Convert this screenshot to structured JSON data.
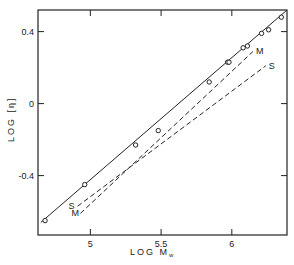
{
  "chart_data": {
    "type": "scatter",
    "title": "",
    "xlabel": "LOG M",
    "xlabel_subscript": "w",
    "ylabel": "LOG [η]",
    "xlim": [
      4.63,
      6.39
    ],
    "ylim": [
      -0.73,
      0.52
    ],
    "xticks": [
      5,
      5.5,
      6
    ],
    "xtick_labels": [
      "5",
      "5.5",
      "6"
    ],
    "yticks": [
      0.4,
      0,
      -0.4
    ],
    "ytick_labels": [
      "0.4",
      "0",
      "-0.4"
    ],
    "grid": false,
    "legend": null,
    "series": [
      {
        "name": "data",
        "style": "open-circle",
        "points": [
          [
            4.68,
            -0.65
          ],
          [
            4.96,
            -0.45
          ],
          [
            5.32,
            -0.23
          ],
          [
            5.48,
            -0.15
          ],
          [
            5.84,
            0.12
          ],
          [
            5.97,
            0.23
          ],
          [
            5.98,
            0.23
          ],
          [
            6.08,
            0.31
          ],
          [
            6.11,
            0.32
          ],
          [
            6.21,
            0.39
          ],
          [
            6.26,
            0.41
          ],
          [
            6.35,
            0.48
          ]
        ]
      },
      {
        "name": "fit",
        "style": "solid-line",
        "points": [
          [
            4.65,
            -0.66
          ],
          [
            6.39,
            0.52
          ]
        ]
      },
      {
        "name": "M",
        "style": "dashed-line",
        "label": "M",
        "points": [
          [
            4.93,
            -0.61
          ],
          [
            6.15,
            0.29
          ]
        ]
      },
      {
        "name": "S",
        "style": "dashed-line",
        "label": "S",
        "points": [
          [
            4.91,
            -0.57
          ],
          [
            6.24,
            0.21
          ]
        ]
      }
    ]
  }
}
